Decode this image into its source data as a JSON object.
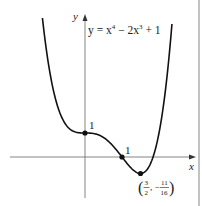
{
  "figure": {
    "equation": "y = x⁴ − 2x³ + 1",
    "equation_parts": {
      "lhs": "y = x",
      "exp1": "4",
      "mid": " − 2x",
      "exp2": "3",
      "rhs": " + 1"
    },
    "axis_labels": {
      "x": "x",
      "y": "y"
    },
    "points": [
      {
        "label": "1",
        "coords": [
          0,
          1
        ],
        "description": "y-intercept"
      },
      {
        "label": "1",
        "coords": [
          1,
          0
        ],
        "description": "x-intercept / inflection"
      },
      {
        "label": "(3/2, −11/16)",
        "coords": [
          1.5,
          -0.6875
        ],
        "description": "local minimum",
        "label_parts": {
          "n1": "3",
          "d1": "2",
          "sep": ", −",
          "n2": "11",
          "d2": "16"
        }
      }
    ],
    "colors": {
      "curve": "#111111",
      "axes": "#555555",
      "border": "#888888"
    }
  }
}
